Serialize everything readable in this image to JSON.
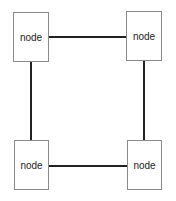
{
  "diagram": {
    "type": "graph",
    "layout": "square-cycle",
    "colors": {
      "background": "#ffffff",
      "edge": "#222222",
      "node_border": "#8a8a8a",
      "node_text": "#222222"
    },
    "nodes": [
      {
        "id": "top-left",
        "label": "node"
      },
      {
        "id": "top-right",
        "label": "node"
      },
      {
        "id": "bottom-left",
        "label": "node"
      },
      {
        "id": "bottom-right",
        "label": "node"
      }
    ],
    "edges": [
      {
        "from": "top-left",
        "to": "top-right"
      },
      {
        "from": "top-left",
        "to": "bottom-left"
      },
      {
        "from": "top-right",
        "to": "bottom-right"
      },
      {
        "from": "bottom-left",
        "to": "bottom-right"
      }
    ]
  }
}
